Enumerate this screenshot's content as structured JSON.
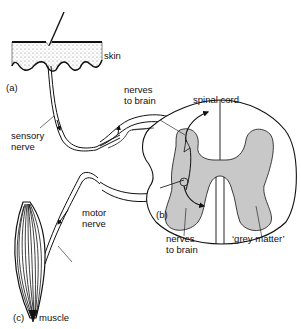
{
  "diagram": {
    "labels": {
      "skin": "skin",
      "part_a": "(a)",
      "nerves_to_brain_top_1": "nerves",
      "nerves_to_brain_top_2": "to brain",
      "spinal_cord": "spinal cord",
      "sensory_nerve_1": "sensory",
      "sensory_nerve_2": "nerve",
      "motor_nerve_1": "motor",
      "motor_nerve_2": "nerve",
      "part_b": "(b)",
      "nerves_to_brain_bottom_1": "nerves",
      "nerves_to_brain_bottom_2": "to brain",
      "grey_matter": "‘grey matter’",
      "part_c": "(c)",
      "muscle": "muscle"
    },
    "colors": {
      "ink": "#111111",
      "grey_matter": "#c8c8c8",
      "skin_stipple": "#888888"
    }
  }
}
